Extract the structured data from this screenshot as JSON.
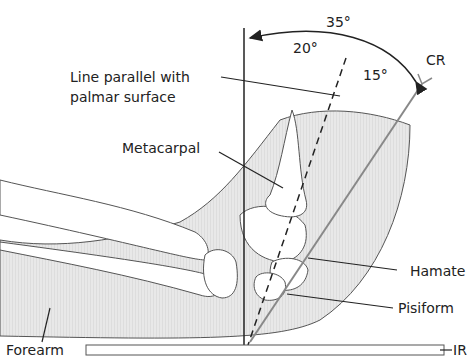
{
  "diagram": {
    "angles": {
      "total": "35°",
      "palmar": "20°",
      "remaining": "15°"
    },
    "labels": {
      "cr": "CR",
      "line_parallel_1": "Line parallel with",
      "line_parallel_2": "palmar surface",
      "metacarpal": "Metacarpal",
      "hamate": "Hamate",
      "pisiform": "Pisiform",
      "forearm": "Forearm",
      "ir": "IR"
    },
    "colors": {
      "line": "#222222",
      "cr_line": "#888888",
      "tissue_fill": "#e4e4e4",
      "bone_fill": "#ffffff"
    }
  }
}
